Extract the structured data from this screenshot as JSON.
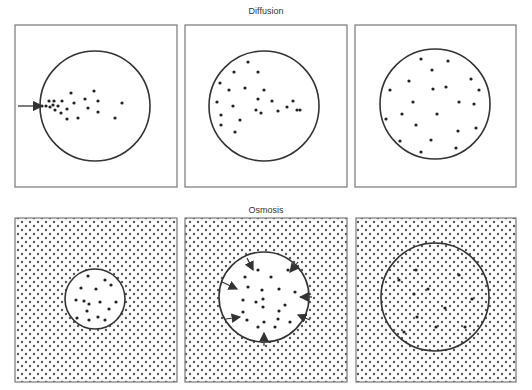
{
  "sections": {
    "diffusion": {
      "title": "Diffusion"
    },
    "osmosis": {
      "title": "Osmosis"
    }
  },
  "colors": {
    "stroke": "#333333",
    "border": "#777777",
    "dot": "#222222",
    "pattern_dot": "#555555",
    "background": "#ffffff"
  },
  "diffusion_panels": [
    {
      "stage": "initial",
      "frame": {
        "x": 15,
        "y": 25,
        "w": 162,
        "h": 162
      },
      "circle": {
        "cx": 95,
        "cy": 106,
        "r": 55
      },
      "entry_arrow": {
        "x1": 18,
        "y1": 106,
        "x2": 42,
        "y2": 106
      },
      "particles": [
        [
          42,
          106
        ],
        [
          46,
          106
        ],
        [
          50,
          107
        ],
        [
          53,
          105
        ],
        [
          49,
          101
        ],
        [
          54,
          101
        ],
        [
          58,
          106
        ],
        [
          62,
          101
        ],
        [
          55,
          110
        ],
        [
          61,
          113
        ],
        [
          67,
          109
        ],
        [
          71,
          93
        ],
        [
          74,
          103
        ],
        [
          85,
          99
        ],
        [
          88,
          108
        ],
        [
          94,
          91
        ],
        [
          98,
          101
        ],
        [
          98,
          112
        ],
        [
          78,
          118
        ],
        [
          67,
          119
        ],
        [
          115,
          118
        ],
        [
          122,
          103
        ]
      ]
    },
    {
      "stage": "spreading",
      "frame": {
        "x": 185,
        "y": 25,
        "w": 162,
        "h": 162
      },
      "circle": {
        "cx": 264,
        "cy": 106,
        "r": 55
      },
      "particles": [
        [
          248,
          62
        ],
        [
          234,
          72
        ],
        [
          258,
          72
        ],
        [
          220,
          83
        ],
        [
          229,
          90
        ],
        [
          245,
          88
        ],
        [
          264,
          90
        ],
        [
          217,
          102
        ],
        [
          258,
          99
        ],
        [
          272,
          101
        ],
        [
          233,
          106
        ],
        [
          256,
          110
        ],
        [
          261,
          113
        ],
        [
          278,
          111
        ],
        [
          287,
          107
        ],
        [
          293,
          101
        ],
        [
          297,
          110
        ],
        [
          221,
          115
        ],
        [
          300,
          110
        ],
        [
          240,
          120
        ],
        [
          221,
          125
        ],
        [
          235,
          132
        ]
      ]
    },
    {
      "stage": "equilibrium",
      "frame": {
        "x": 355,
        "y": 25,
        "w": 161,
        "h": 162
      },
      "circle": {
        "cx": 435,
        "cy": 104,
        "r": 55
      },
      "particles": [
        [
          421,
          59
        ],
        [
          448,
          61
        ],
        [
          432,
          70
        ],
        [
          409,
          81
        ],
        [
          471,
          79
        ],
        [
          390,
          90
        ],
        [
          433,
          89
        ],
        [
          446,
          87
        ],
        [
          479,
          90
        ],
        [
          413,
          102
        ],
        [
          459,
          102
        ],
        [
          474,
          104
        ],
        [
          402,
          114
        ],
        [
          437,
          114
        ],
        [
          386,
          119
        ],
        [
          416,
          125
        ],
        [
          458,
          131
        ],
        [
          476,
          128
        ],
        [
          400,
          141
        ],
        [
          431,
          140
        ],
        [
          456,
          148
        ],
        [
          421,
          152
        ]
      ]
    }
  ],
  "osmosis_panels": [
    {
      "stage": "small-cell",
      "frame": {
        "x": 15,
        "y": 218,
        "w": 162,
        "h": 164
      },
      "circle": {
        "cx": 95,
        "cy": 299,
        "r": 30
      },
      "particles": [
        [
          88,
          276
        ],
        [
          105,
          280
        ],
        [
          81,
          288
        ],
        [
          96,
          289
        ],
        [
          111,
          285
        ],
        [
          76,
          300
        ],
        [
          84,
          301
        ],
        [
          89,
          304
        ],
        [
          100,
          302
        ],
        [
          116,
          302
        ],
        [
          87,
          311
        ],
        [
          109,
          309
        ],
        [
          77,
          318
        ],
        [
          89,
          320
        ],
        [
          98,
          317
        ],
        [
          105,
          320
        ]
      ]
    },
    {
      "stage": "water-entering",
      "frame": {
        "x": 185,
        "y": 218,
        "w": 162,
        "h": 164
      },
      "circle": {
        "cx": 264,
        "cy": 297,
        "r": 45
      },
      "inward_arrows": [
        {
          "x1": 247,
          "y1": 258,
          "x2": 253,
          "y2": 270
        },
        {
          "x1": 298,
          "y1": 262,
          "x2": 290,
          "y2": 272
        },
        {
          "x1": 222,
          "y1": 282,
          "x2": 237,
          "y2": 289
        },
        {
          "x1": 312,
          "y1": 297,
          "x2": 300,
          "y2": 297
        },
        {
          "x1": 310,
          "y1": 320,
          "x2": 298,
          "y2": 315
        },
        {
          "x1": 226,
          "y1": 319,
          "x2": 240,
          "y2": 317
        },
        {
          "x1": 264,
          "y1": 346,
          "x2": 264,
          "y2": 333
        }
      ],
      "particles": [
        [
          258,
          270
        ],
        [
          245,
          277
        ],
        [
          271,
          277
        ],
        [
          288,
          270
        ],
        [
          248,
          287
        ],
        [
          262,
          290
        ],
        [
          279,
          289
        ],
        [
          243,
          300
        ],
        [
          263,
          299
        ],
        [
          295,
          292
        ],
        [
          256,
          302
        ],
        [
          285,
          305
        ],
        [
          263,
          307
        ],
        [
          243,
          312
        ],
        [
          279,
          311
        ],
        [
          247,
          320
        ],
        [
          278,
          319
        ],
        [
          264,
          322
        ],
        [
          258,
          327
        ],
        [
          275,
          327
        ],
        [
          290,
          322
        ]
      ]
    },
    {
      "stage": "swollen-cell",
      "frame": {
        "x": 356,
        "y": 218,
        "w": 160,
        "h": 164
      },
      "circle": {
        "cx": 435,
        "cy": 297,
        "r": 54
      },
      "particles": [
        [
          416,
          270
        ],
        [
          459,
          275
        ],
        [
          399,
          280
        ],
        [
          428,
          289
        ],
        [
          414,
          294
        ],
        [
          472,
          299
        ],
        [
          445,
          308
        ],
        [
          417,
          317
        ],
        [
          436,
          327
        ],
        [
          465,
          327
        ],
        [
          404,
          332
        ]
      ]
    }
  ],
  "pattern": {
    "spacing": 8,
    "dot_radius": 1.2
  }
}
